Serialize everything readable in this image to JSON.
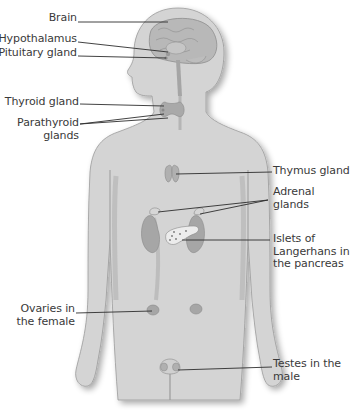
{
  "diagram": {
    "colors": {
      "background": "#ffffff",
      "body_fill": "#d4d4d4",
      "body_outline": "#9a9a9a",
      "organ_fill": "#a9a9a9",
      "leader_line": "#2e2e2e",
      "label_text": "#3a3a3a"
    },
    "labels_left": [
      {
        "id": "brain",
        "text": "Brain"
      },
      {
        "id": "hypothalamus",
        "text": "Hypothalamus"
      },
      {
        "id": "pituitary",
        "text": "Pituitary gland"
      },
      {
        "id": "thyroid",
        "text": "Thyroid gland"
      },
      {
        "id": "parathyroid",
        "text": "Parathyroid\nglands"
      },
      {
        "id": "ovaries",
        "text": "Ovaries in\nthe female"
      }
    ],
    "labels_right": [
      {
        "id": "thymus",
        "text": "Thymus gland"
      },
      {
        "id": "adrenal",
        "text": "Adrenal\nglands"
      },
      {
        "id": "islets",
        "text": "Islets of\nLangerhans in\nthe pancreas"
      },
      {
        "id": "testes",
        "text": "Testes in the\nmale"
      }
    ]
  }
}
